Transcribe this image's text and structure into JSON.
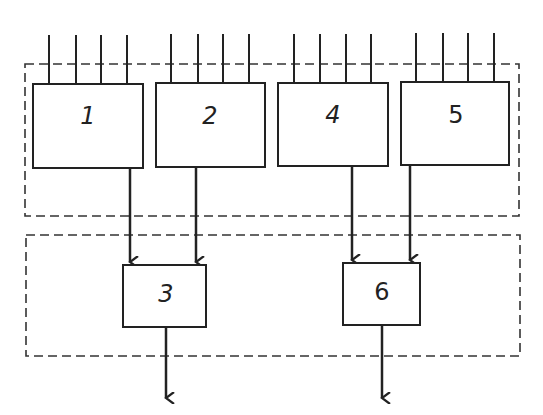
{
  "diagram": {
    "stroke_color": "#222222",
    "background": "#ffffff",
    "groups": [
      {
        "id": "upper-group",
        "x": 25,
        "y": 64,
        "w": 494,
        "h": 152
      },
      {
        "id": "lower-group",
        "x": 26,
        "y": 235,
        "w": 494,
        "h": 121
      }
    ],
    "blocks": [
      {
        "id": "1",
        "label": "1",
        "x": 33,
        "y": 84,
        "w": 110,
        "h": 84,
        "inputs": [
          49,
          76,
          101,
          127
        ]
      },
      {
        "id": "2",
        "label": "2",
        "x": 156,
        "y": 83,
        "w": 109,
        "h": 84,
        "inputs": [
          171,
          198,
          223,
          249
        ]
      },
      {
        "id": "4",
        "label": "4",
        "x": 278,
        "y": 83,
        "w": 110,
        "h": 83,
        "inputs": [
          294,
          320,
          346,
          371
        ]
      },
      {
        "id": "5",
        "label": "5",
        "x": 401,
        "y": 82,
        "w": 108,
        "h": 83,
        "inputs": [
          416,
          443,
          468,
          494
        ]
      },
      {
        "id": "3",
        "label": "3",
        "x": 123,
        "y": 265,
        "w": 83,
        "h": 62
      },
      {
        "id": "6",
        "label": "6",
        "x": 343,
        "y": 263,
        "w": 77,
        "h": 62
      }
    ],
    "connections": [
      {
        "from": "1",
        "to": "3"
      },
      {
        "from": "2",
        "to": "3"
      },
      {
        "from": "4",
        "to": "6"
      },
      {
        "from": "5",
        "to": "6"
      },
      {
        "from": "3",
        "to": "output"
      },
      {
        "from": "6",
        "to": "output"
      }
    ]
  }
}
